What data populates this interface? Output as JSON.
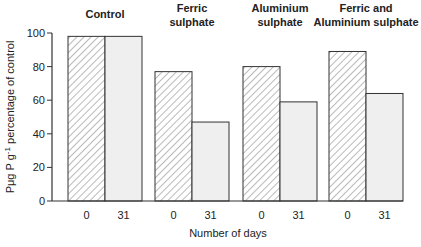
{
  "chart_data": {
    "type": "bar",
    "title": "",
    "xlabel": "Number of days",
    "ylabel": "Pμg P g-1 percentage of control",
    "ylabel_parts": {
      "pre": "Pμg P g",
      "sup": "-1",
      "post": " percentage of control"
    },
    "ylim": [
      0,
      100
    ],
    "yticks": [
      0,
      20,
      40,
      60,
      80,
      100
    ],
    "grid": false,
    "legend": "none",
    "groups": [
      {
        "label_lines": [
          "Control"
        ],
        "categories": [
          "0",
          "31"
        ],
        "values": [
          98,
          98
        ]
      },
      {
        "label_lines": [
          "Ferric",
          "sulphate"
        ],
        "categories": [
          "0",
          "31"
        ],
        "values": [
          77,
          47
        ]
      },
      {
        "label_lines": [
          "Aluminium",
          "sulphate"
        ],
        "categories": [
          "0",
          "31"
        ],
        "values": [
          80,
          59
        ]
      },
      {
        "label_lines": [
          "Ferric and",
          "Aluminium sulphate"
        ],
        "categories": [
          "0",
          "31"
        ],
        "values": [
          89,
          64
        ]
      }
    ],
    "series": [
      {
        "name": "Day 0",
        "pattern": "hatched",
        "values": [
          98,
          77,
          80,
          89
        ]
      },
      {
        "name": "Day 31",
        "pattern": "light-gray",
        "values": [
          98,
          47,
          59,
          64
        ]
      }
    ],
    "categories": [
      "Control",
      "Ferric sulphate",
      "Aluminium sulphate",
      "Ferric and Aluminium sulphate"
    ],
    "colors": {
      "axis": "#333333",
      "bar_stroke": "#333333",
      "hatch": "#555555",
      "day31_fill": "#efefef",
      "day0_fill": "#ffffff"
    }
  }
}
